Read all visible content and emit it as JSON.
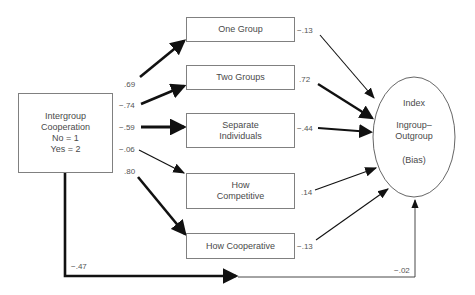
{
  "source_node": {
    "lines": [
      "Intergroup",
      "Cooperation",
      "No = 1",
      "Yes = 2"
    ]
  },
  "mediators": [
    {
      "lines": [
        "One Group"
      ],
      "path_in": ".69",
      "path_out": "−.13"
    },
    {
      "lines": [
        "Two Groups"
      ],
      "path_in": "−.74",
      "path_out": ".72"
    },
    {
      "lines": [
        "Separate",
        "Individuals"
      ],
      "path_in": "−.59",
      "path_out": "−.44"
    },
    {
      "lines": [
        "How",
        "Competitive"
      ],
      "path_in": "−.06",
      "path_out": ".14"
    },
    {
      "lines": [
        "How Cooperative"
      ],
      "path_in": ".80",
      "path_out": "−.13"
    }
  ],
  "outcome_node": {
    "line1": "Index",
    "line2": "Ingroup–",
    "line3": "Outgroup",
    "line4": "(Bias)"
  },
  "direct_path": {
    "first_segment": "−.47",
    "second_segment": "−.02"
  }
}
